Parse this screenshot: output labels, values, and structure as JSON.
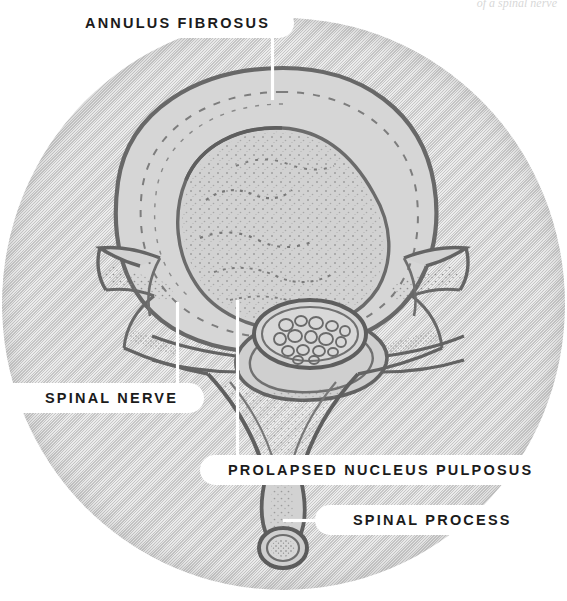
{
  "figure": {
    "style": "halftone grayscale medical engraving in circular vignette",
    "top_caption": "of a spinal nerve"
  },
  "colors": {
    "background": "#ffffff",
    "vignette_fill": "#d3d3d3",
    "ink": "#6f6f6f",
    "ink_dark": "#5a5a5a",
    "label_pill": "#ffffff",
    "label_text": "#1b1b1b",
    "leader_line": "#ffffff"
  },
  "labels": [
    {
      "id": "annulus-fibrosus",
      "text": "ANNULUS FIBROSUS",
      "leader": {
        "orientation": "vertical",
        "x": 272,
        "y_top": 38,
        "y_bottom": 100
      }
    },
    {
      "id": "spinal-nerve",
      "text": "SPINAL NERVE",
      "leader": {
        "orientation": "vertical",
        "x": 177,
        "y_top": 302,
        "y_bottom": 385
      }
    },
    {
      "id": "prolapsed-nucleus-pulposus",
      "text": "PROLAPSED NUCLEUS PULPOSUS",
      "leader": {
        "orientation": "vertical",
        "x": 237,
        "y_top": 300,
        "y_bottom": 458
      }
    },
    {
      "id": "spinal-process",
      "text": "SPINAL PROCESS",
      "leader": {
        "orientation": "horizontal",
        "y": 520,
        "x_left": 283,
        "x_right": 330
      }
    }
  ],
  "anatomy": {
    "parts": [
      "annulus fibrosus",
      "nucleus pulposus (prolapsed)",
      "vertebral body",
      "spinal canal with cauda equina nerve roots",
      "transverse process (left)",
      "transverse process (right)",
      "superior articular facet (left)",
      "superior articular facet (right)",
      "pedicle",
      "lamina",
      "spinous process"
    ]
  }
}
